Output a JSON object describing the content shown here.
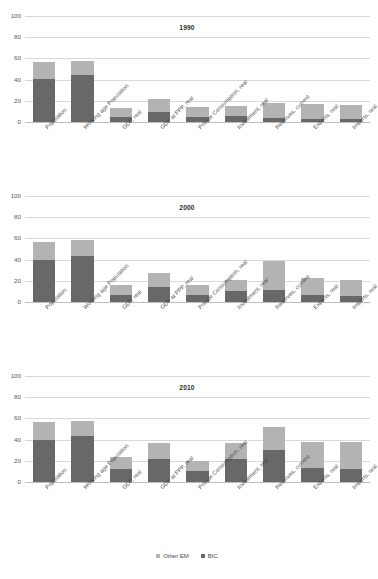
{
  "figure": {
    "top_cut_text": "",
    "caption_cut_text": ""
  },
  "legend": {
    "position": "bottom-center",
    "items": [
      {
        "label": "Other EM",
        "color": "#b3b3b3",
        "key": "other_em"
      },
      {
        "label": "BIC",
        "color": "#686868",
        "key": "bic"
      }
    ]
  },
  "chart_data": [
    {
      "type": "bar",
      "stacked": true,
      "title": "1990",
      "xlabel": "",
      "ylabel": "",
      "ylim": [
        0,
        100
      ],
      "yticks": [
        0,
        20,
        40,
        60,
        80,
        100
      ],
      "grid": true,
      "categories": [
        "Population",
        "Working age Population",
        "GDP, real",
        "GDP at PPP, real",
        "Private Consumption, real",
        "Investment, real",
        "Reserves, current",
        "Exports, real",
        "Imports, real"
      ],
      "series": [
        {
          "name": "BIC",
          "color": "#686868",
          "values": [
            40.5,
            44.0,
            4.5,
            9.5,
            5.0,
            6.0,
            3.5,
            3.0,
            2.5
          ]
        },
        {
          "name": "Other EM",
          "color": "#b3b3b3",
          "values": [
            16.5,
            14.0,
            9.0,
            12.5,
            9.5,
            9.0,
            14.5,
            14.0,
            13.5
          ]
        }
      ],
      "totals": [
        57.0,
        58.0,
        13.5,
        22.0,
        14.5,
        15.0,
        18.0,
        17.0,
        16.0
      ]
    },
    {
      "type": "bar",
      "stacked": true,
      "title": "2000",
      "xlabel": "",
      "ylabel": "",
      "ylim": [
        0,
        100
      ],
      "yticks": [
        0,
        20,
        40,
        60,
        80,
        100
      ],
      "grid": true,
      "categories": [
        "Population",
        "Working age Population",
        "GDP, real",
        "GDP at PPP, real",
        "Private Consumption, real",
        "Investment, real",
        "Reserves, current",
        "Exports, real",
        "Imports, real"
      ],
      "series": [
        {
          "name": "BIC",
          "color": "#686868",
          "values": [
            39.5,
            43.0,
            7.0,
            14.0,
            6.5,
            10.0,
            11.5,
            6.5,
            5.5
          ]
        },
        {
          "name": "Other EM",
          "color": "#b3b3b3",
          "values": [
            17.5,
            15.5,
            9.5,
            13.0,
            10.0,
            11.0,
            27.0,
            16.5,
            15.5
          ]
        }
      ],
      "totals": [
        57.0,
        58.5,
        16.5,
        27.0,
        16.5,
        21.0,
        38.5,
        23.0,
        21.0
      ]
    },
    {
      "type": "bar",
      "stacked": true,
      "title": "2010",
      "xlabel": "",
      "ylabel": "",
      "ylim": [
        0,
        100
      ],
      "yticks": [
        0,
        20,
        40,
        60,
        80,
        100
      ],
      "grid": true,
      "categories": [
        "Population",
        "Working age Population",
        "GDP, real",
        "GDP at PPP, real",
        "Private Consumption, real",
        "Investment, real",
        "Reserves, current",
        "Exports, real",
        "Imports, real"
      ],
      "series": [
        {
          "name": "BIC",
          "color": "#686868",
          "values": [
            39.5,
            43.0,
            12.5,
            22.0,
            10.0,
            21.5,
            30.5,
            13.5,
            12.5
          ]
        },
        {
          "name": "Other EM",
          "color": "#b3b3b3",
          "values": [
            17.0,
            15.0,
            11.0,
            14.5,
            10.0,
            15.5,
            21.0,
            24.5,
            25.0
          ]
        }
      ],
      "totals": [
        56.5,
        58.0,
        23.5,
        36.5,
        20.0,
        37.0,
        51.5,
        38.0,
        37.5
      ]
    }
  ]
}
